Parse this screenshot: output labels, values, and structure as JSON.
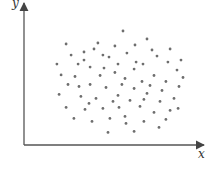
{
  "chart_data": {
    "type": "scatter",
    "title": "",
    "xlabel": "x",
    "ylabel": "y",
    "xlim": [
      0,
      100
    ],
    "ylim": [
      0,
      100
    ],
    "grid": false,
    "ticks": false,
    "legend": null,
    "annotations": [],
    "marker_color": "#6e6e6e",
    "axis_color": "#555555",
    "series": [
      {
        "name": "points",
        "points": [
          [
            55.3,
            79.7
          ],
          [
            68.7,
            74.1
          ],
          [
            23.5,
            70.6
          ],
          [
            39.1,
            67.1
          ],
          [
            44.1,
            62.9
          ],
          [
            50.8,
            69.2
          ],
          [
            33.5,
            59.4
          ],
          [
            36.9,
            54.5
          ],
          [
            30.2,
            56.6
          ],
          [
            18.4,
            56.6
          ],
          [
            57.5,
            64.3
          ],
          [
            62.6,
            58.0
          ],
          [
            66.5,
            56.6
          ],
          [
            61.5,
            53.1
          ],
          [
            74.3,
            62.2
          ],
          [
            80.4,
            58.0
          ],
          [
            85.5,
            52.4
          ],
          [
            47.5,
            61.5
          ],
          [
            28.5,
            47.9
          ],
          [
            20.7,
            49.0
          ],
          [
            42.5,
            48.6
          ],
          [
            50.8,
            50.7
          ],
          [
            56.4,
            46.5
          ],
          [
            72.6,
            48.6
          ],
          [
            79.3,
            44.4
          ],
          [
            24.6,
            42.3
          ],
          [
            36.9,
            42.3
          ],
          [
            45.8,
            40.2
          ],
          [
            61.5,
            39.5
          ],
          [
            70.4,
            41.6
          ],
          [
            77.1,
            38.1
          ],
          [
            86.6,
            40.9
          ],
          [
            19.6,
            35.4
          ],
          [
            31.8,
            34.0
          ],
          [
            40.2,
            32.6
          ],
          [
            52.5,
            34.7
          ],
          [
            59.2,
            31.2
          ],
          [
            67.0,
            31.9
          ],
          [
            76.0,
            30.5
          ],
          [
            83.8,
            32.6
          ],
          [
            23.5,
            26.3
          ],
          [
            34.1,
            24.9
          ],
          [
            44.1,
            25.6
          ],
          [
            53.1,
            26.3
          ],
          [
            64.8,
            27.0
          ],
          [
            72.6,
            22.8
          ],
          [
            81.6,
            24.2
          ],
          [
            27.9,
            18.6
          ],
          [
            38.0,
            16.5
          ],
          [
            48.0,
            18.6
          ],
          [
            57.0,
            15.1
          ],
          [
            67.0,
            16.5
          ],
          [
            75.4,
            12.3
          ],
          [
            46.9,
            8.8
          ],
          [
            61.5,
            9.5
          ],
          [
            88.8,
            47.2
          ],
          [
            33.5,
            65.0
          ],
          [
            62.0,
            69.9
          ],
          [
            71.5,
            66.4
          ],
          [
            52.5,
            56.6
          ],
          [
            44.7,
            53.8
          ],
          [
            65.9,
            44.4
          ],
          [
            87.7,
            59.4
          ],
          [
            41.3,
            71.3
          ],
          [
            26.3,
            62.9
          ],
          [
            81.6,
            67.1
          ],
          [
            54.7,
            42.3
          ],
          [
            30.7,
            40.9
          ],
          [
            86.1,
            25.6
          ],
          [
            56.4,
            20.0
          ],
          [
            36.3,
            29.1
          ],
          [
            79.3,
            17.9
          ],
          [
            68.7,
            36.1
          ],
          [
            49.7,
            30.5
          ]
        ]
      }
    ]
  },
  "labels": {
    "x_axis": "x",
    "y_axis": "y"
  }
}
